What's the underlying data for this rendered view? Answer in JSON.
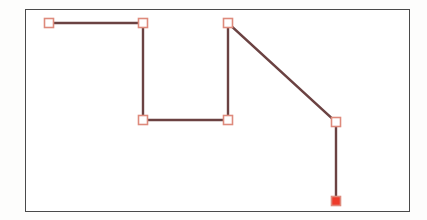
{
  "canvas": {
    "width": 427,
    "height": 220,
    "background": "#fdfdfc"
  },
  "frame": {
    "x": 25,
    "y": 9,
    "width": 385,
    "height": 203,
    "border_color": "#4a4a4a",
    "border_width": 1.5,
    "fill": "#ffffff"
  },
  "chart_data": {
    "type": "line",
    "title": "",
    "subtitle": "",
    "xlabel": "",
    "ylabel": "",
    "grid": false,
    "legend": null,
    "axis_ticks": [],
    "tick_labels": [],
    "annotations": [],
    "xlim": [
      25,
      410
    ],
    "ylim": [
      9,
      212
    ],
    "series": [
      {
        "name": "path",
        "line_color": "#6b4242",
        "line_width": 2.4,
        "marker": "square",
        "marker_size": 9,
        "marker_edge_color": "#de8a7c",
        "marker_face_color": "#ffffff",
        "points": [
          {
            "x": 49,
            "y": 23,
            "filled": false
          },
          {
            "x": 143,
            "y": 23,
            "filled": false
          },
          {
            "x": 143,
            "y": 120,
            "filled": false
          },
          {
            "x": 228,
            "y": 120,
            "filled": false
          },
          {
            "x": 228,
            "y": 23,
            "filled": false
          },
          {
            "x": 336,
            "y": 122,
            "filled": false
          },
          {
            "x": 336,
            "y": 201,
            "filled": true
          }
        ]
      }
    ],
    "marker_fill_highlight": "#ee3b2b"
  }
}
